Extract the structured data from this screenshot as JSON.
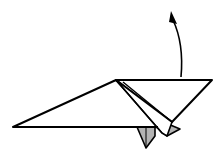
{
  "diagram": {
    "type": "origami-fold-step",
    "instruction_arrow": "fold-up",
    "colors": {
      "paper_front": "#ffffff",
      "paper_back": "#b3b3b3",
      "line": "#000000"
    }
  }
}
